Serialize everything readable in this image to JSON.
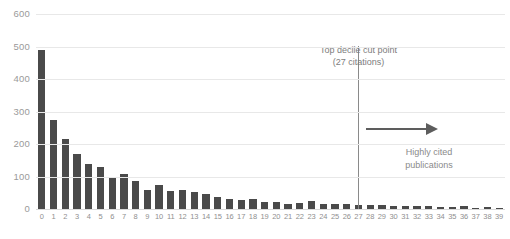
{
  "chart_data": {
    "type": "bar",
    "title": "",
    "subtitle": "",
    "xlabel": "",
    "ylabel": "",
    "ylim": [
      0,
      600
    ],
    "yticks": [
      0,
      100,
      200,
      300,
      400,
      500,
      600
    ],
    "grid": true,
    "legend": "none",
    "bar_color": "#4a4a4a",
    "categories": [
      "0",
      "1",
      "2",
      "3",
      "4",
      "5",
      "6",
      "7",
      "8",
      "9",
      "10",
      "11",
      "12",
      "13",
      "14",
      "15",
      "16",
      "17",
      "18",
      "19",
      "20",
      "21",
      "22",
      "23",
      "24",
      "25",
      "26",
      "27",
      "28",
      "29",
      "30",
      "31",
      "32",
      "33",
      "34",
      "35",
      "36",
      "37",
      "38",
      "39"
    ],
    "values": [
      490,
      274,
      214,
      168,
      138,
      130,
      95,
      108,
      85,
      60,
      75,
      56,
      57,
      53,
      47,
      36,
      31,
      29,
      30,
      23,
      21,
      16,
      17,
      26,
      16,
      15,
      14,
      13,
      12,
      11,
      10,
      9,
      8,
      8,
      7,
      6,
      10,
      4,
      5,
      3
    ],
    "annotations": [
      {
        "name": "top-decile-cut-point",
        "line_at_x": 27,
        "label_line1": "Top decile cut point",
        "label_line2": "(27 citations)",
        "color": "#8a8a8a"
      },
      {
        "name": "highly-cited-arrow",
        "label_line1": "Highly cited",
        "label_line2": "publications",
        "direction": "right",
        "color": "#5d5d5d"
      }
    ]
  },
  "axis": {
    "y_tick_color": "#9a9a9a",
    "x_tick_color": "#8f8f8f",
    "gridline_color": "#e8e8e8"
  }
}
